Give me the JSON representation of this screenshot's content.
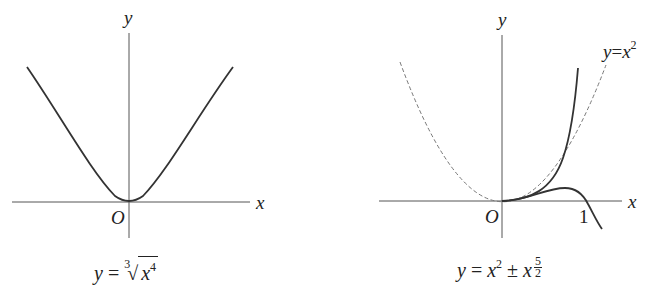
{
  "figures": [
    {
      "id": "left",
      "axis_labels": {
        "x": "x",
        "y": "y",
        "origin": "O"
      },
      "caption": {
        "lhs": "y",
        "eq": "=",
        "root_index": "3",
        "radicand_base": "x",
        "radicand_exp": "4"
      },
      "curve": "y = cube_root(x^4)",
      "stroke": "#333333"
    },
    {
      "id": "right",
      "axis_labels": {
        "x": "x",
        "y": "y",
        "origin": "O",
        "tick_1": "1"
      },
      "reference_label": {
        "lhs": "y",
        "eq": "=",
        "base": "x",
        "exp": "2"
      },
      "caption": {
        "lhs": "y",
        "eq": "=",
        "base": "x",
        "exp": "2",
        "pm": "±",
        "base2": "x",
        "frac_num": "5",
        "frac_den": "2"
      },
      "curves": [
        "y = x^2 + x^(5/2)",
        "y = x^2 - x^(5/2)",
        "y = x^2 (dashed)"
      ],
      "stroke": "#333333",
      "dashed_stroke": "#777777"
    }
  ]
}
